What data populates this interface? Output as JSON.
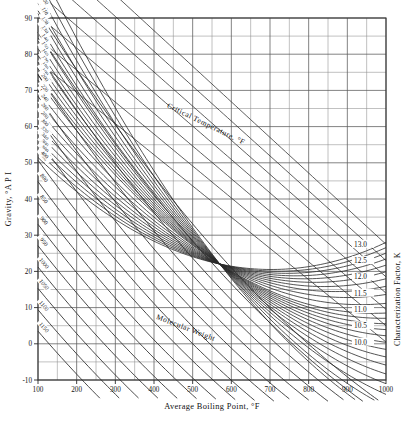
{
  "figure": {
    "kind": "nomograph",
    "background": "#ffffff",
    "ink": "#1a1a1a"
  },
  "chart_data": {
    "type": "line",
    "title": "",
    "xlabel": "Average Boiling Point, °F",
    "ylabel": "Gravity, °A P I",
    "y2label": "Characterization Factor, K",
    "xlim": [
      100,
      1000
    ],
    "ylim": [
      -10,
      90
    ],
    "xticks": [
      100,
      200,
      300,
      400,
      500,
      600,
      700,
      800,
      900,
      1000
    ],
    "xtick_labels": [
      "100",
      "200",
      "300",
      "400",
      "500",
      "600",
      "700",
      "800",
      "900",
      "1000"
    ],
    "xminor_step": 50,
    "yticks": [
      -10,
      0,
      10,
      20,
      30,
      40,
      50,
      60,
      70,
      80,
      90
    ],
    "ytick_labels": [
      "-10",
      "0",
      "10",
      "20",
      "30",
      "40",
      "50",
      "60",
      "70",
      "80",
      "90"
    ],
    "yminor_step": 5,
    "grid": "on",
    "legend": "none",
    "series": [
      {
        "name": "Critical Temperature, °F",
        "family_label": "Critical Temperature, °F",
        "label_values": [
          "400",
          "450",
          "500",
          "550",
          "600",
          "650",
          "700",
          "750",
          "800",
          "850",
          "900",
          "950",
          "1000",
          "1050",
          "1100",
          "1150"
        ],
        "values": [
          400,
          450,
          500,
          550,
          600,
          650,
          700,
          750,
          800,
          850,
          900,
          950,
          1000,
          1050,
          1100,
          1150
        ]
      },
      {
        "name": "Molecular Weight",
        "family_label": "Molecular Weight",
        "label_values": [
          "70",
          "80",
          "90",
          "100",
          "110",
          "120",
          "130",
          "140",
          "150",
          "160",
          "170",
          "180",
          "190",
          "200",
          "220",
          "240",
          "260",
          "280",
          "300",
          "320",
          "340",
          "360",
          "380",
          "400"
        ],
        "values": [
          70,
          80,
          90,
          100,
          110,
          120,
          130,
          140,
          150,
          160,
          170,
          180,
          190,
          200,
          220,
          240,
          260,
          280,
          300,
          320,
          340,
          360,
          380,
          400
        ]
      },
      {
        "name": "Characterization Factor, K",
        "family_label": "Characterization Factor, K",
        "label_values": [
          "13.0",
          "12.5",
          "12.0",
          "11.5",
          "11.0",
          "10.5",
          "10.0"
        ],
        "values": [
          13.0,
          12.5,
          12.0,
          11.5,
          11.0,
          10.5,
          10.0
        ]
      }
    ]
  },
  "axes": {
    "x_title": "Average Boiling Point, °F",
    "y_title": "Gravity, °A P I",
    "k_title": "Characterization Factor, K"
  },
  "families": {
    "critical_temperature": "Critical Temperature, °F",
    "molecular_weight": "Molecular Weight",
    "k_factor": "Characterization Factor, K"
  }
}
